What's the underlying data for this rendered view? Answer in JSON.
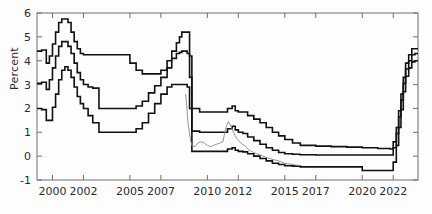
{
  "chart_data": {
    "type": "line",
    "title": "",
    "xlabel": "",
    "ylabel": "Percent",
    "ylim": [
      -1,
      6
    ],
    "xlim": [
      1999.0,
      2023.6
    ],
    "yticks": [
      -1,
      0,
      1,
      2,
      3,
      4,
      5,
      6
    ],
    "ytick_labels": [
      "-1",
      "0",
      "1",
      "2",
      "3",
      "4",
      "5",
      "6"
    ],
    "xticks": [
      2000,
      2002,
      2005,
      2007,
      2010,
      2012,
      2015,
      2017,
      2020,
      2022
    ],
    "xtick_labels": [
      "2000",
      "2002",
      "2005",
      "2007",
      "2010",
      "2012",
      "2015",
      "2017",
      "2020",
      "2022"
    ],
    "grid": false,
    "legend": "none",
    "series": [
      {
        "name": "upper-band",
        "color": "#111111",
        "style": "step",
        "width": 1.6,
        "x": [
          1999.0,
          1999.3,
          1999.6,
          1999.8,
          2000.0,
          2000.2,
          2000.4,
          2000.6,
          2000.8,
          2001.0,
          2001.2,
          2001.4,
          2001.6,
          2001.8,
          2002.0,
          2002.3,
          2002.6,
          2003.0,
          2003.4,
          2003.8,
          2004.2,
          2004.6,
          2005.0,
          2005.4,
          2005.8,
          2006.2,
          2006.6,
          2007.0,
          2007.4,
          2007.7,
          2008.0,
          2008.2,
          2008.35,
          2008.5,
          2008.7,
          2008.85,
          2009.0,
          2009.5,
          2010.0,
          2010.5,
          2011.0,
          2011.3,
          2011.6,
          2011.8,
          2012.0,
          2012.3,
          2012.6,
          2013.0,
          2013.4,
          2013.8,
          2014.2,
          2014.6,
          2015.0,
          2015.5,
          2016.0,
          2017.0,
          2018.0,
          2019.0,
          2020.0,
          2021.0,
          2021.8,
          2022.0,
          2022.2,
          2022.35,
          2022.5,
          2022.65,
          2022.8,
          2023.0,
          2023.2,
          2023.4,
          2023.6
        ],
        "y": [
          4.4,
          4.45,
          3.9,
          4.2,
          4.7,
          5.2,
          5.6,
          5.75,
          5.75,
          5.6,
          5.2,
          4.8,
          4.5,
          4.3,
          4.25,
          4.25,
          4.25,
          4.25,
          4.25,
          4.25,
          4.25,
          4.25,
          3.9,
          3.6,
          3.45,
          3.45,
          3.45,
          3.6,
          4.0,
          4.4,
          4.75,
          5.0,
          5.2,
          5.2,
          5.2,
          4.2,
          2.0,
          1.85,
          1.85,
          1.85,
          1.85,
          2.0,
          2.1,
          1.9,
          1.85,
          1.85,
          1.7,
          1.55,
          1.4,
          1.2,
          1.0,
          0.85,
          0.7,
          0.55,
          0.45,
          0.42,
          0.4,
          0.38,
          0.35,
          0.32,
          0.3,
          0.6,
          1.2,
          1.9,
          2.6,
          3.3,
          3.9,
          4.25,
          4.5,
          4.5,
          4.5
        ]
      },
      {
        "name": "middle-band",
        "color": "#111111",
        "style": "step",
        "width": 1.6,
        "x": [
          1999.0,
          1999.3,
          1999.6,
          1999.8,
          2000.0,
          2000.2,
          2000.4,
          2000.6,
          2000.8,
          2001.0,
          2001.2,
          2001.4,
          2001.6,
          2001.8,
          2002.0,
          2002.3,
          2002.6,
          2003.0,
          2003.4,
          2003.8,
          2004.2,
          2004.6,
          2005.0,
          2005.4,
          2005.8,
          2006.2,
          2006.6,
          2007.0,
          2007.4,
          2007.7,
          2008.0,
          2008.2,
          2008.35,
          2008.5,
          2008.7,
          2008.85,
          2009.0,
          2009.5,
          2010.0,
          2010.5,
          2011.0,
          2011.3,
          2011.6,
          2011.8,
          2012.0,
          2012.3,
          2012.6,
          2013.0,
          2013.4,
          2013.8,
          2014.2,
          2014.6,
          2015.0,
          2015.5,
          2016.0,
          2017.0,
          2018.0,
          2019.0,
          2020.0,
          2021.0,
          2021.8,
          2022.0,
          2022.2,
          2022.35,
          2022.5,
          2022.65,
          2022.8,
          2023.0,
          2023.2,
          2023.4,
          2023.6
        ],
        "y": [
          3.05,
          3.1,
          2.8,
          3.2,
          3.7,
          4.2,
          4.6,
          4.8,
          4.8,
          4.6,
          4.3,
          3.9,
          3.5,
          3.2,
          3.0,
          2.9,
          2.85,
          2.0,
          2.0,
          2.0,
          2.0,
          2.0,
          2.0,
          2.1,
          2.3,
          2.65,
          2.95,
          3.3,
          3.7,
          4.1,
          4.3,
          4.35,
          4.4,
          4.4,
          4.3,
          3.3,
          1.05,
          1.0,
          1.0,
          1.0,
          1.0,
          1.15,
          1.25,
          1.1,
          1.0,
          0.95,
          0.8,
          0.65,
          0.5,
          0.35,
          0.25,
          0.15,
          0.1,
          0.08,
          0.06,
          0.05,
          0.05,
          0.05,
          0.05,
          0.05,
          0.05,
          0.35,
          0.95,
          1.65,
          2.35,
          3.05,
          3.65,
          4.0,
          4.25,
          4.3,
          4.3
        ]
      },
      {
        "name": "lower-band",
        "color": "#111111",
        "style": "step",
        "width": 1.6,
        "x": [
          1999.0,
          1999.3,
          1999.6,
          1999.8,
          2000.0,
          2000.2,
          2000.4,
          2000.6,
          2000.8,
          2001.0,
          2001.2,
          2001.4,
          2001.6,
          2001.8,
          2002.0,
          2002.3,
          2002.6,
          2003.0,
          2003.4,
          2003.8,
          2004.2,
          2004.6,
          2005.0,
          2005.4,
          2005.8,
          2006.2,
          2006.6,
          2007.0,
          2007.4,
          2007.7,
          2008.0,
          2008.2,
          2008.35,
          2008.5,
          2008.7,
          2008.85,
          2009.0,
          2009.5,
          2010.0,
          2010.5,
          2011.0,
          2011.3,
          2011.6,
          2011.8,
          2012.0,
          2012.3,
          2012.6,
          2013.0,
          2013.4,
          2013.8,
          2014.2,
          2014.6,
          2015.0,
          2015.5,
          2016.0,
          2017.0,
          2018.0,
          2019.0,
          2019.6,
          2020.0,
          2021.0,
          2021.8,
          2022.0,
          2022.2,
          2022.35,
          2022.5,
          2022.65,
          2022.8,
          2023.0,
          2023.2,
          2023.4,
          2023.6
        ],
        "y": [
          2.0,
          1.95,
          1.5,
          1.5,
          2.05,
          2.6,
          3.2,
          3.6,
          3.75,
          3.6,
          3.3,
          2.9,
          2.5,
          2.2,
          2.0,
          1.7,
          1.4,
          1.0,
          1.0,
          1.0,
          1.0,
          1.0,
          1.0,
          1.15,
          1.4,
          1.8,
          2.2,
          2.6,
          2.9,
          3.0,
          3.0,
          3.0,
          3.0,
          3.0,
          2.9,
          2.0,
          0.2,
          0.2,
          0.2,
          0.2,
          0.2,
          0.3,
          0.35,
          0.25,
          0.2,
          0.18,
          0.1,
          0.0,
          -0.1,
          -0.2,
          -0.3,
          -0.35,
          -0.4,
          -0.42,
          -0.45,
          -0.45,
          -0.45,
          -0.45,
          -0.45,
          -0.6,
          -0.6,
          -0.6,
          -0.25,
          0.45,
          1.2,
          1.95,
          2.7,
          3.35,
          3.7,
          3.95,
          4.0,
          4.0
        ]
      },
      {
        "name": "actual-rate",
        "color": "#888888",
        "style": "line",
        "width": 0.9,
        "x": [
          2008.6,
          2008.75,
          2008.9,
          2009.0,
          2009.2,
          2009.4,
          2009.6,
          2009.8,
          2010.0,
          2010.2,
          2010.4,
          2010.6,
          2010.8,
          2011.0,
          2011.1,
          2011.2,
          2011.35,
          2011.5,
          2011.65,
          2011.8,
          2011.95,
          2012.1,
          2012.25,
          2012.4,
          2012.55,
          2012.7,
          2012.85,
          2013.0,
          2013.2,
          2013.4,
          2013.6,
          2013.8,
          2014.0,
          2014.3,
          2014.6,
          2015.0,
          2015.5,
          2016.0
        ],
        "y": [
          2.6,
          1.4,
          0.7,
          0.45,
          0.4,
          0.55,
          0.6,
          0.55,
          0.45,
          0.4,
          0.45,
          0.5,
          0.55,
          0.6,
          0.9,
          1.2,
          1.45,
          1.3,
          1.05,
          0.85,
          0.7,
          0.6,
          0.5,
          0.45,
          0.35,
          0.25,
          0.2,
          0.15,
          0.1,
          0.05,
          0.0,
          -0.05,
          -0.1,
          -0.15,
          -0.2,
          -0.3,
          -0.35,
          -0.4
        ]
      }
    ]
  },
  "axes": {
    "frame_color": "#6f6f6f",
    "tick_color": "#6f6f6f"
  }
}
